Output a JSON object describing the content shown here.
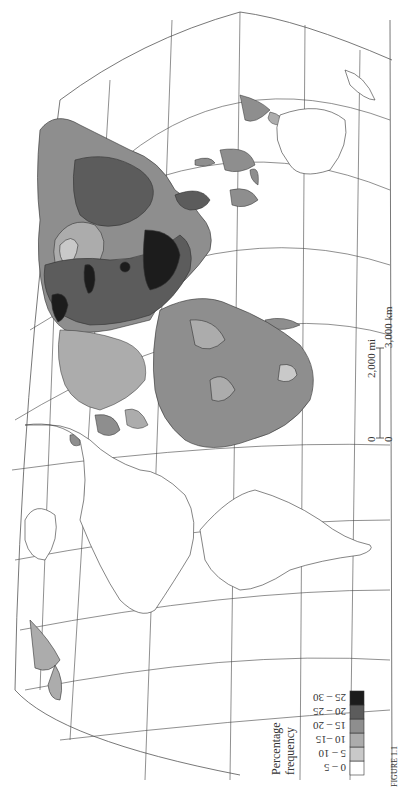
{
  "map": {
    "projection": "world map (rotated 90° counter-clockwise)",
    "legend": {
      "title_line1": "Percentage",
      "title_line2": "frequency",
      "classes": [
        {
          "label": "0 – 5",
          "color": "#ffffff"
        },
        {
          "label": "5 – 10",
          "color": "#c9c9c9"
        },
        {
          "label": "10 –15",
          "color": "#acacac"
        },
        {
          "label": "15 – 20",
          "color": "#8e8e8e"
        },
        {
          "label": "20 – 25",
          "color": "#5c5c5c"
        },
        {
          "label": "25 – 30",
          "color": "#1c1c1c"
        }
      ]
    },
    "scale_bar": {
      "mi_zero": "0",
      "mi_label": "2,000 mi",
      "km_zero": "0",
      "km_label": "3,000 km"
    },
    "caption_fragment": "FIGURE 1.1"
  }
}
